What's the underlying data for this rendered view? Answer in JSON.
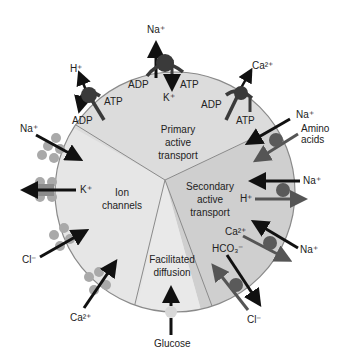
{
  "colors": {
    "background": "#ffffff",
    "primary_region": "#dcdcdc",
    "secondary_region": "#cfcfcf",
    "ion_region": "#e6e6e6",
    "facilitated_region": "#e9e9e9",
    "border": "#8a8a8a",
    "pump": "#3a3a3a",
    "arrow_dark": "#111111",
    "arrow_gray": "#555555",
    "channel": "#a9a9a9",
    "carrier": "#5a5a5a",
    "glucose_carrier": "#d8d8d8"
  },
  "regions": {
    "primary": {
      "line1": "Primary",
      "line2": "active",
      "line3": "transport"
    },
    "secondary": {
      "line1": "Secondary",
      "line2": "active",
      "line3": "transport"
    },
    "ion": {
      "line1": "Ion",
      "line2": "channels"
    },
    "facilitated": {
      "line1": "Facilitated",
      "line2": "diffusion"
    }
  },
  "primary_pumps": {
    "h_pump": {
      "ion": "H⁺",
      "adp": "ADP",
      "atp": "ATP"
    },
    "na_k_pump": {
      "ion_out": "Na⁺",
      "ion_in": "K⁺",
      "adp": "ADP",
      "atp": "ATP"
    },
    "ca_pump": {
      "ion": "Ca²⁺",
      "adp": "ADP",
      "atp": "ATP"
    }
  },
  "secondary_transporters": {
    "na_amino": {
      "ion": "Na⁺",
      "cotransported_line1": "Amino",
      "cotransported_line2": "acids"
    },
    "na_h": {
      "ion": "Na⁺",
      "counter": "H⁺"
    },
    "na_ca": {
      "ion": "Na⁺",
      "counter": "Ca²⁺"
    },
    "cl_hco3": {
      "ion": "Cl⁻",
      "counter": "HCO₃⁻"
    }
  },
  "ion_channels": {
    "na": "Na⁺",
    "k": "K⁺",
    "cl": "Cl⁻",
    "ca": "Ca²⁺"
  },
  "facilitated": {
    "substrate": "Glucose"
  }
}
